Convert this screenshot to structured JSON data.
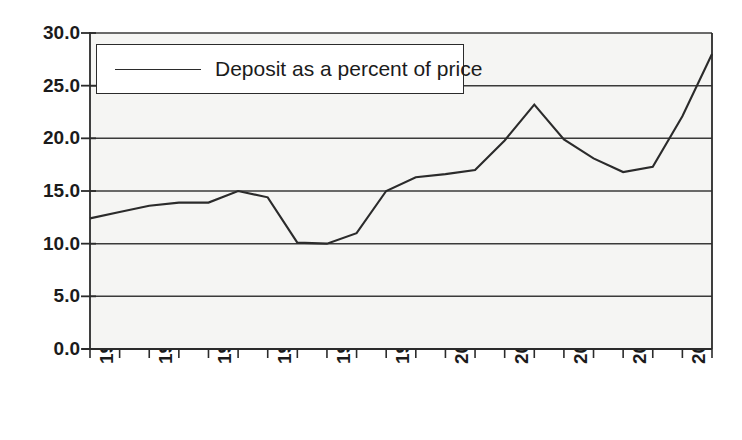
{
  "chart_data": {
    "type": "line",
    "title": "",
    "subtitle": "",
    "xlabel": "",
    "ylabel": "",
    "grid": true,
    "legend_position": "top-left-inside",
    "xlim": [
      1988,
      2009
    ],
    "ylim": [
      0.0,
      30.0
    ],
    "y_ticks": [
      "30.0",
      "25.0",
      "20.0",
      "15.0",
      "10.0",
      "5.0",
      "0.0"
    ],
    "y_tick_values": [
      30.0,
      25.0,
      20.0,
      15.0,
      10.0,
      5.0,
      0.0
    ],
    "x_tick_labels": [
      "1988",
      "1990",
      "1992",
      "1994",
      "1996",
      "1998",
      "2000",
      "2002",
      "2004",
      "2006",
      "2008"
    ],
    "x_tick_values": [
      1988,
      1990,
      1992,
      1994,
      1996,
      1998,
      2000,
      2002,
      2004,
      2006,
      2008
    ],
    "x_minor_tick_values": [
      1989,
      1991,
      1993,
      1995,
      1997,
      1999,
      2001,
      2003,
      2005,
      2007,
      2009
    ],
    "legend": [
      "Deposit as a percent of price"
    ],
    "series": [
      {
        "name": "Deposit as a percent of price",
        "color": "#2b2b2b",
        "x": [
          1988,
          1989,
          1990,
          1991,
          1992,
          1993,
          1994,
          1995,
          1996,
          1997,
          1998,
          1999,
          2000,
          2001,
          2002,
          2003,
          2004,
          2005,
          2006,
          2007,
          2008,
          2009
        ],
        "values": [
          12.4,
          13.0,
          13.6,
          13.9,
          13.9,
          15.0,
          14.4,
          10.1,
          10.0,
          11.0,
          15.0,
          16.3,
          16.6,
          17.0,
          19.8,
          23.2,
          19.9,
          18.1,
          16.8,
          17.3,
          22.1,
          28.0
        ]
      }
    ]
  },
  "legend": {
    "label": "Deposit as a percent of price",
    "swatch_icon": "line-swatch-icon"
  },
  "colors": {
    "line": "#2b2b2b",
    "axis": "#2b2b2b",
    "grid": "#3a3a3a",
    "plot_background": "#f5f5f3",
    "page_background": "#ffffff",
    "text": "#1b1b1b"
  },
  "plot_geometry": {
    "left": 90,
    "right": 712,
    "top": 33,
    "bottom": 349
  }
}
